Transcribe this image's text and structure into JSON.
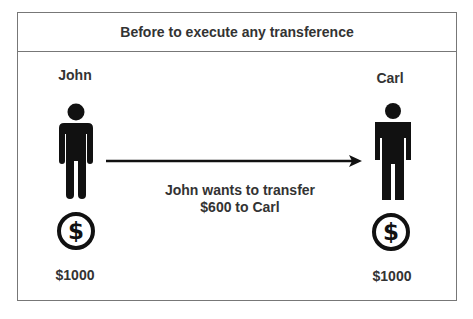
{
  "title": "Before to execute any transference",
  "sender": {
    "name": "John",
    "balance": "$1000",
    "icon": "person-icon",
    "coin_icon": "dollar-coin-icon"
  },
  "receiver": {
    "name": "Carl",
    "balance": "$1000",
    "icon": "person-icon",
    "coin_icon": "dollar-coin-icon"
  },
  "transfer": {
    "line1": "John wants to transfer",
    "line2": "$600 to Carl",
    "icon": "arrow-right-icon"
  },
  "colors": {
    "border": "#777777",
    "text": "#333333",
    "icon": "#111111"
  }
}
